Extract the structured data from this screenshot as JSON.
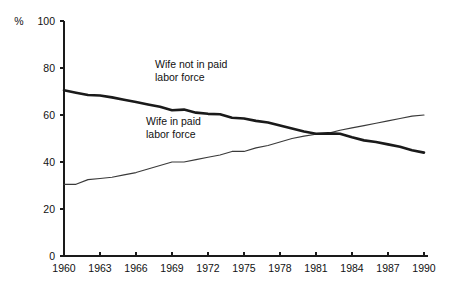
{
  "chart_data": {
    "type": "line",
    "title": "",
    "subtitle": "",
    "xlabel": "",
    "ylabel": "%",
    "unit_label": "%",
    "xlim": [
      1960,
      1990
    ],
    "ylim": [
      0,
      100
    ],
    "grid": false,
    "legend_position": "inline-annotation",
    "x_tick_labels": [
      "1960",
      "1963",
      "1966",
      "1969",
      "1972",
      "1975",
      "1978",
      "1981",
      "1984",
      "1987",
      "1990"
    ],
    "x_tick_values": [
      1960,
      1963,
      1966,
      1969,
      1972,
      1975,
      1978,
      1981,
      1984,
      1987,
      1990
    ],
    "y_tick_labels": [
      "0",
      "20",
      "40",
      "60",
      "80",
      "100"
    ],
    "y_tick_values": [
      0,
      20,
      40,
      60,
      80,
      100
    ],
    "x": [
      1960,
      1961,
      1962,
      1963,
      1964,
      1965,
      1966,
      1967,
      1968,
      1969,
      1970,
      1971,
      1972,
      1973,
      1974,
      1975,
      1976,
      1977,
      1978,
      1979,
      1980,
      1981,
      1982,
      1983,
      1984,
      1985,
      1986,
      1987,
      1988,
      1989,
      1990
    ],
    "series": [
      {
        "name": "Wife not in paid labor force",
        "style": "bold",
        "color": "#1a1a1a",
        "values": [
          70.5,
          69.5,
          68.5,
          68.3,
          67.5,
          66.5,
          65.5,
          64.5,
          63.5,
          62.0,
          62.3,
          61.0,
          60.5,
          60.3,
          58.8,
          58.5,
          57.5,
          56.8,
          55.5,
          54.3,
          53.0,
          52.0,
          52.2,
          52.0,
          50.5,
          49.2,
          48.5,
          47.5,
          46.5,
          45.0,
          44.0
        ]
      },
      {
        "name": "Wife in paid labor force",
        "style": "thin",
        "color": "#3a3a3a",
        "values": [
          30.5,
          30.5,
          32.5,
          33.0,
          33.5,
          34.5,
          35.5,
          37.0,
          38.5,
          40.0,
          40.0,
          41.0,
          42.0,
          43.0,
          44.5,
          44.5,
          46.0,
          47.0,
          48.5,
          50.0,
          51.0,
          51.8,
          52.2,
          53.5,
          54.5,
          55.5,
          56.5,
          57.5,
          58.5,
          59.5,
          60.0
        ]
      }
    ],
    "annotations": [
      {
        "id": "annot-wife-not-in-paid",
        "lines": [
          "Wife not in paid",
          "labor force"
        ],
        "x_px": 155,
        "y_px": 68
      },
      {
        "id": "annot-wife-in-paid",
        "lines": [
          "Wife in paid",
          "labor force"
        ],
        "x_px": 146,
        "y_px": 125
      }
    ],
    "crossover": {
      "year": 1981,
      "value": 52.0
    }
  },
  "plot_geometry": {
    "left_px": 64,
    "right_px": 424,
    "top_px": 21,
    "bottom_px": 256
  }
}
